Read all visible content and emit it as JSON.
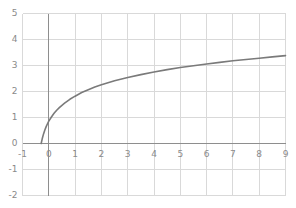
{
  "chart_data": {
    "type": "line",
    "title": "",
    "subtitle": "",
    "xlabel": "",
    "ylabel": "",
    "xlim": [
      -1,
      9
    ],
    "ylim": [
      -2,
      5
    ],
    "xticks": [
      -1,
      0,
      1,
      2,
      3,
      4,
      5,
      6,
      7,
      8,
      9
    ],
    "yticks": [
      -2,
      -1,
      0,
      1,
      2,
      3,
      4,
      5
    ],
    "xtick_labels": [
      "-1",
      "0",
      "1",
      "2",
      "3",
      "4",
      "5",
      "6",
      "7",
      "8",
      "9"
    ],
    "ytick_labels": [
      "-2",
      "-1",
      "0",
      "1",
      "2",
      "3",
      "4",
      "5"
    ],
    "grid": true,
    "legend": null,
    "legend_position": "none",
    "annotations": [],
    "series": [
      {
        "name": "curve",
        "color": "#7a7a7a",
        "line_width": 1.6,
        "x": [
          -0.29,
          -0.25,
          -0.2,
          -0.15,
          -0.1,
          -0.05,
          0.0,
          0.1,
          0.2,
          0.3,
          0.4,
          0.5,
          0.6,
          0.8,
          1.0,
          1.25,
          1.5,
          1.75,
          2.0,
          2.5,
          3.0,
          3.5,
          4.0,
          4.5,
          5.0,
          5.5,
          6.0,
          6.5,
          7.0,
          7.5,
          8.0,
          8.5,
          9.0
        ],
        "y": [
          0.0,
          0.18,
          0.37,
          0.52,
          0.65,
          0.76,
          0.86,
          1.02,
          1.16,
          1.28,
          1.38,
          1.47,
          1.55,
          1.7,
          1.82,
          1.96,
          2.07,
          2.17,
          2.26,
          2.41,
          2.54,
          2.65,
          2.75,
          2.84,
          2.92,
          2.99,
          3.06,
          3.12,
          3.18,
          3.23,
          3.28,
          3.33,
          3.38
        ]
      }
    ]
  },
  "style": {
    "grid_color": "#d9d9d9",
    "axis_color": "#8e8e8e",
    "curve_color": "#7a7a7a",
    "tick_text_color": "#8a8a8a",
    "background": "#ffffff"
  }
}
